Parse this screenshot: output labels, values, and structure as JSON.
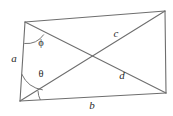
{
  "figure": {
    "kind": "geometry-diagram",
    "stroke_color": "#6e6e6e",
    "label_color": "#2b2b2b",
    "background_color": "#ffffff",
    "vertices": {
      "top_left": {
        "x": 25,
        "y": 22
      },
      "top_right": {
        "x": 165,
        "y": 11
      },
      "bottom_right": {
        "x": 166,
        "y": 93
      },
      "bottom_left": {
        "x": 20,
        "y": 101
      }
    },
    "edges": [
      {
        "name": "left-side",
        "from": "top_left",
        "to": "bottom_left",
        "label": "a"
      },
      {
        "name": "bottom-side",
        "from": "bottom_left",
        "to": "bottom_right",
        "label": "b"
      },
      {
        "name": "top-side",
        "from": "top_left",
        "to": "top_right",
        "label": ""
      },
      {
        "name": "right-side",
        "from": "top_right",
        "to": "bottom_right",
        "label": ""
      }
    ],
    "diagonals": [
      {
        "name": "diagonal-c",
        "from": "bottom_left",
        "to": "top_right",
        "label": "c"
      },
      {
        "name": "diagonal-d",
        "from": "top_left",
        "to": "bottom_right",
        "label": "d"
      }
    ],
    "labels": [
      {
        "name": "side-label-a",
        "text": "a",
        "x": 14,
        "y": 58,
        "style": "italic"
      },
      {
        "name": "side-label-b",
        "text": "b",
        "x": 92,
        "y": 105,
        "style": "italic"
      },
      {
        "name": "diagonal-label-c",
        "text": "c",
        "x": 116,
        "y": 33,
        "style": "italic"
      },
      {
        "name": "diagonal-label-d",
        "text": "d",
        "x": 122,
        "y": 75,
        "style": "italic"
      },
      {
        "name": "angle-label-phi",
        "text": "ϕ",
        "x": 41,
        "y": 43,
        "style": "greek"
      },
      {
        "name": "angle-label-theta",
        "text": "θ",
        "x": 41,
        "y": 74,
        "style": "greek"
      }
    ],
    "angle_arcs": [
      {
        "name": "angle-arc-phi",
        "at": "top_left",
        "between": [
          "left-side",
          "diagonal-d"
        ]
      },
      {
        "name": "angle-arc-theta",
        "at": "bottom_left",
        "between": [
          "left-side",
          "diagonal-c"
        ]
      },
      {
        "name": "angle-arc-bottom-left-small",
        "at": "bottom_left",
        "between": [
          "diagonal-c",
          "bottom-side"
        ]
      }
    ]
  }
}
